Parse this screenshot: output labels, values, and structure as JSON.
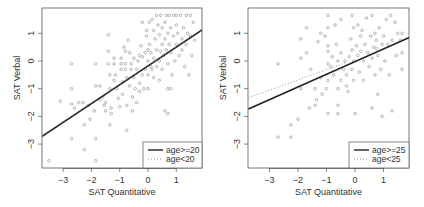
{
  "chart_data": [
    {
      "type": "scatter",
      "title": "",
      "xlabel": "SAT Quantitative",
      "ylabel": "SAT Verbal",
      "xticks": [
        -3,
        -2,
        -1,
        0,
        1
      ],
      "yticks": [
        -3,
        -2,
        -1,
        0,
        1
      ],
      "xlim": [
        -3.74,
        1.91
      ],
      "ylim": [
        -3.86,
        1.91
      ],
      "grid": false,
      "legend_position": "bottom-right",
      "legend": [
        {
          "label": "age>=20",
          "style": "solid"
        },
        {
          "label": "age<20",
          "style": "dotted"
        }
      ],
      "lines": [
        {
          "name": "age>=20",
          "style": "solid",
          "x": [
            -3.74,
            1.91
          ],
          "y": [
            -2.72,
            1.12
          ]
        },
        {
          "name": "age<20",
          "style": "dotted",
          "x": [
            -3.74,
            1.91
          ],
          "y": [
            -2.68,
            1.1
          ]
        }
      ],
      "points": [
        [
          -3.5,
          -3.6
        ],
        [
          -3.1,
          -1.45
        ],
        [
          -2.7,
          -0.1
        ],
        [
          -2.7,
          -1.0
        ],
        [
          -2.7,
          -1.55
        ],
        [
          -2.7,
          -2.8
        ],
        [
          -2.6,
          -1.7
        ],
        [
          -2.45,
          -1.5
        ],
        [
          -2.3,
          -1.5
        ],
        [
          -2.25,
          -2.3
        ],
        [
          -2.25,
          -3.2
        ],
        [
          -2.1,
          -1.6
        ],
        [
          -2.05,
          -2.1
        ],
        [
          -1.9,
          -1.8
        ],
        [
          -1.85,
          -0.1
        ],
        [
          -1.85,
          -0.9
        ],
        [
          -1.85,
          -2.8
        ],
        [
          -1.85,
          -3.6
        ],
        [
          -1.7,
          -0.9
        ],
        [
          -1.7,
          -1.4
        ],
        [
          -1.6,
          -1.3
        ],
        [
          -1.55,
          -1.6
        ],
        [
          -1.5,
          -1.8
        ],
        [
          -1.4,
          0.95
        ],
        [
          -1.4,
          0.35
        ],
        [
          -1.4,
          -0.1
        ],
        [
          -1.35,
          -0.5
        ],
        [
          -1.35,
          -1.0
        ],
        [
          -1.3,
          -1.7
        ],
        [
          -1.35,
          -2.3
        ],
        [
          -1.3,
          -1.9
        ],
        [
          -1.2,
          0.1
        ],
        [
          -1.2,
          -0.1
        ],
        [
          -1.15,
          -0.5
        ],
        [
          -1.1,
          -1.0
        ],
        [
          -1.05,
          -1.35
        ],
        [
          -1.0,
          -1.65
        ],
        [
          -0.95,
          0.1
        ],
        [
          -0.95,
          -0.1
        ],
        [
          -0.95,
          -0.3
        ],
        [
          -0.9,
          -1.2
        ],
        [
          -0.85,
          0.5
        ],
        [
          -0.8,
          0.35
        ],
        [
          -0.8,
          -0.1
        ],
        [
          -0.8,
          -0.3
        ],
        [
          -0.75,
          -0.6
        ],
        [
          -0.75,
          -1.6
        ],
        [
          -0.75,
          -2.5
        ],
        [
          -0.7,
          0.75
        ],
        [
          -0.65,
          0.3
        ],
        [
          -0.65,
          -0.9
        ],
        [
          -0.6,
          -0.1
        ],
        [
          -0.6,
          -0.3
        ],
        [
          -0.55,
          -1.3
        ],
        [
          -0.55,
          -1.8
        ],
        [
          -0.5,
          0.1
        ],
        [
          -0.5,
          -0.6
        ],
        [
          -0.45,
          -1.0
        ],
        [
          -0.4,
          -0.3
        ],
        [
          -0.4,
          -1.5
        ],
        [
          -0.35,
          0.0
        ],
        [
          -0.3,
          -0.8
        ],
        [
          -0.3,
          -1.1
        ],
        [
          -0.25,
          0.55
        ],
        [
          -0.2,
          1.4
        ],
        [
          -0.2,
          0.15
        ],
        [
          -0.2,
          -0.5
        ],
        [
          -0.15,
          -1.0
        ],
        [
          -0.1,
          0.3
        ],
        [
          -0.1,
          -0.3
        ],
        [
          -0.05,
          1.1
        ],
        [
          -0.05,
          0.9
        ],
        [
          0.0,
          0.4
        ],
        [
          0.0,
          0.0
        ],
        [
          0.0,
          -0.5
        ],
        [
          0.0,
          -1.0
        ],
        [
          0.05,
          1.4
        ],
        [
          0.05,
          0.6
        ],
        [
          0.1,
          0.3
        ],
        [
          0.15,
          1.5
        ],
        [
          0.15,
          -0.3
        ],
        [
          0.2,
          1.1
        ],
        [
          0.2,
          0.1
        ],
        [
          0.2,
          -0.6
        ],
        [
          0.25,
          0.8
        ],
        [
          0.3,
          1.65
        ],
        [
          0.3,
          0.4
        ],
        [
          0.3,
          -0.2
        ],
        [
          0.35,
          1.3
        ],
        [
          0.4,
          0.95
        ],
        [
          0.4,
          0.0
        ],
        [
          0.4,
          -0.7
        ],
        [
          0.45,
          1.65
        ],
        [
          0.5,
          1.2
        ],
        [
          0.5,
          0.6
        ],
        [
          0.5,
          -0.3
        ],
        [
          0.55,
          0.2
        ],
        [
          0.6,
          1.4
        ],
        [
          0.6,
          0.8
        ],
        [
          0.6,
          -1.8
        ],
        [
          0.65,
          1.65
        ],
        [
          0.65,
          0.4
        ],
        [
          0.7,
          1.0
        ],
        [
          0.7,
          -0.1
        ],
        [
          0.7,
          -1.0
        ],
        [
          0.75,
          1.65
        ],
        [
          0.75,
          0.6
        ],
        [
          0.8,
          1.2
        ],
        [
          0.8,
          0.3
        ],
        [
          0.85,
          -0.5
        ],
        [
          0.9,
          1.65
        ],
        [
          0.9,
          0.9
        ],
        [
          0.95,
          0.0
        ],
        [
          1.0,
          1.65
        ],
        [
          1.0,
          1.3
        ],
        [
          1.0,
          0.6
        ],
        [
          1.05,
          1.0
        ],
        [
          1.1,
          0.2
        ],
        [
          1.15,
          1.65
        ],
        [
          1.2,
          0.8
        ],
        [
          1.25,
          1.2
        ],
        [
          1.3,
          -0.2
        ],
        [
          1.35,
          1.65
        ],
        [
          1.35,
          0.6
        ],
        [
          1.4,
          1.0
        ],
        [
          1.45,
          -0.5
        ],
        [
          1.5,
          1.65
        ],
        [
          1.5,
          0.9
        ],
        [
          1.55,
          0.2
        ],
        [
          1.6,
          1.4
        ],
        [
          1.65,
          0.75
        ],
        [
          -0.1,
          -3.3
        ],
        [
          0.7,
          -1.9
        ],
        [
          -1.5,
          -1.5
        ],
        [
          -1.2,
          -0.7
        ],
        [
          -0.9,
          -0.75
        ],
        [
          -0.3,
          0.2
        ],
        [
          0.1,
          -0.2
        ],
        [
          0.45,
          0.35
        ],
        [
          0.8,
          -1.0
        ],
        [
          1.2,
          0.4
        ]
      ]
    },
    {
      "type": "scatter",
      "title": "",
      "xlabel": "SAT Quantitative",
      "ylabel": "SAT Verbal",
      "xticks": [
        -3,
        -2,
        -1,
        0,
        1
      ],
      "yticks": [
        -3,
        -2,
        -1,
        0,
        1
      ],
      "xlim": [
        -3.74,
        1.95
      ],
      "ylim": [
        -3.86,
        1.91
      ],
      "grid": false,
      "legend_position": "bottom-right",
      "legend": [
        {
          "label": "age>=25",
          "style": "solid"
        },
        {
          "label": "age<25",
          "style": "dotted"
        }
      ],
      "lines": [
        {
          "name": "age>=25",
          "style": "solid",
          "x": [
            -3.74,
            1.95
          ],
          "y": [
            -1.73,
            0.87
          ]
        },
        {
          "name": "age<25",
          "style": "dotted",
          "x": [
            -3.74,
            -0.3
          ],
          "y": [
            -1.33,
            -0.05
          ]
        }
      ],
      "points": [
        [
          -2.7,
          -0.1
        ],
        [
          -2.7,
          -2.75
        ],
        [
          -2.25,
          -2.3
        ],
        [
          -2.25,
          -2.75
        ],
        [
          -2.0,
          -2.1
        ],
        [
          -1.9,
          0.8
        ],
        [
          -1.9,
          0.1
        ],
        [
          -1.9,
          -1.0
        ],
        [
          -1.7,
          1.2
        ],
        [
          -1.7,
          0.3
        ],
        [
          -1.6,
          -1.7
        ],
        [
          -1.55,
          -0.3
        ],
        [
          -1.4,
          -1.6
        ],
        [
          -1.4,
          -1.0
        ],
        [
          -1.35,
          -1.4
        ],
        [
          -1.3,
          0.7
        ],
        [
          -1.2,
          1.0
        ],
        [
          -1.2,
          -0.6
        ],
        [
          -1.15,
          -1.2
        ],
        [
          -1.05,
          0.9
        ],
        [
          -1.0,
          -1.0
        ],
        [
          -0.95,
          1.65
        ],
        [
          -0.95,
          1.2
        ],
        [
          -0.95,
          0.55
        ],
        [
          -0.95,
          0.35
        ],
        [
          -0.95,
          -0.1
        ],
        [
          -0.95,
          -0.7
        ],
        [
          -0.95,
          -1.9
        ],
        [
          -0.85,
          -0.2
        ],
        [
          -0.8,
          0.15
        ],
        [
          -0.75,
          -0.5
        ],
        [
          -0.7,
          1.3
        ],
        [
          -0.65,
          0.6
        ],
        [
          -0.6,
          0.0
        ],
        [
          -0.6,
          -1.0
        ],
        [
          -0.6,
          -1.6
        ],
        [
          -0.6,
          -1.9
        ],
        [
          -0.5,
          1.5
        ],
        [
          -0.5,
          0.3
        ],
        [
          -0.5,
          -0.7
        ],
        [
          -0.4,
          -0.3
        ],
        [
          -0.35,
          0.0
        ],
        [
          -0.3,
          -0.9
        ],
        [
          -0.25,
          -1.1
        ],
        [
          -0.2,
          0.15
        ],
        [
          -0.15,
          0.8
        ],
        [
          -0.1,
          1.65
        ],
        [
          -0.1,
          0.4
        ],
        [
          -0.1,
          -0.3
        ],
        [
          -0.05,
          1.2
        ],
        [
          -0.05,
          0.0
        ],
        [
          -0.05,
          -0.7
        ],
        [
          0.0,
          -1.9
        ],
        [
          0.05,
          0.55
        ],
        [
          0.1,
          1.3
        ],
        [
          0.1,
          0.2
        ],
        [
          0.15,
          -0.4
        ],
        [
          0.2,
          0.9
        ],
        [
          0.25,
          1.1
        ],
        [
          0.3,
          0.0
        ],
        [
          0.3,
          -0.7
        ],
        [
          0.35,
          0.6
        ],
        [
          0.4,
          1.55
        ],
        [
          0.45,
          0.3
        ],
        [
          0.5,
          -0.2
        ],
        [
          0.55,
          0.9
        ],
        [
          0.6,
          1.65
        ],
        [
          0.6,
          0.1
        ],
        [
          0.6,
          -1.7
        ],
        [
          0.65,
          0.5
        ],
        [
          0.7,
          1.0
        ],
        [
          0.7,
          -0.5
        ],
        [
          0.75,
          0.75
        ],
        [
          0.8,
          0.2
        ],
        [
          0.8,
          -1.2
        ],
        [
          0.85,
          1.2
        ],
        [
          0.9,
          -0.3
        ],
        [
          0.95,
          0.6
        ],
        [
          0.95,
          -2.0
        ],
        [
          1.0,
          0.9
        ],
        [
          1.05,
          0.0
        ],
        [
          1.1,
          1.5
        ],
        [
          1.15,
          0.6
        ],
        [
          1.2,
          -0.5
        ],
        [
          1.25,
          1.65
        ],
        [
          1.3,
          0.75
        ],
        [
          1.3,
          -1.8
        ],
        [
          1.4,
          1.4
        ],
        [
          1.45,
          0.2
        ],
        [
          1.5,
          1.0
        ],
        [
          1.6,
          0.75
        ],
        [
          1.65,
          0.3
        ],
        [
          1.65,
          -0.3
        ],
        [
          1.65,
          1.0
        ],
        [
          0.75,
          0.45
        ],
        [
          0.2,
          0.35
        ],
        [
          -0.3,
          -0.5
        ]
      ]
    }
  ]
}
